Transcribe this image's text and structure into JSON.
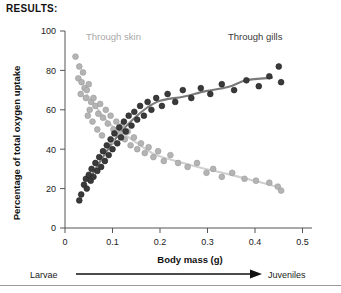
{
  "heading": "RESULTS:",
  "chart_data": {
    "type": "scatter",
    "title": "",
    "xlabel": "Body mass (g)",
    "ylabel": "Percentage of total oxygen uptake",
    "xlim": [
      0,
      0.52
    ],
    "ylim": [
      0,
      100
    ],
    "xticks": [
      0,
      0.1,
      0.2,
      0.3,
      0.4,
      0.5
    ],
    "xtick_labels": [
      "0",
      "0.1",
      "0.2",
      "0.3",
      "0.4",
      "0.5"
    ],
    "yticks": [
      0,
      20,
      40,
      60,
      80,
      100
    ],
    "ytick_labels": [
      "0",
      "20",
      "40",
      "60",
      "80",
      "100"
    ],
    "grid": false,
    "legend_position": "in-plot-annotations",
    "annotations": [
      {
        "text": "Through skin",
        "x": 0.085,
        "y": 96,
        "color": "#a8a8a8"
      },
      {
        "text": "Through gills",
        "x": 0.34,
        "y": 96,
        "color": "#3a3a3a"
      }
    ],
    "axis_arrow": {
      "left_label": "Larvae",
      "right_label": "Juveniles",
      "direction": "left-to-right"
    },
    "series": [
      {
        "name": "Through skin",
        "marker": "circle",
        "color": "#b4b4b4",
        "edge_color": "#9a9a9a",
        "trend_color": "#d0d0d0",
        "points": [
          [
            0.022,
            87
          ],
          [
            0.03,
            82
          ],
          [
            0.028,
            76
          ],
          [
            0.035,
            74
          ],
          [
            0.038,
            79
          ],
          [
            0.041,
            71
          ],
          [
            0.033,
            68
          ],
          [
            0.046,
            70
          ],
          [
            0.05,
            73
          ],
          [
            0.044,
            66
          ],
          [
            0.055,
            64
          ],
          [
            0.052,
            60
          ],
          [
            0.048,
            57
          ],
          [
            0.06,
            66
          ],
          [
            0.064,
            62
          ],
          [
            0.058,
            54
          ],
          [
            0.07,
            58
          ],
          [
            0.074,
            63
          ],
          [
            0.068,
            50
          ],
          [
            0.08,
            56
          ],
          [
            0.086,
            60
          ],
          [
            0.09,
            53
          ],
          [
            0.078,
            47
          ],
          [
            0.096,
            57
          ],
          [
            0.102,
            50
          ],
          [
            0.108,
            54
          ],
          [
            0.1,
            44
          ],
          [
            0.115,
            48
          ],
          [
            0.12,
            52
          ],
          [
            0.126,
            45
          ],
          [
            0.132,
            49
          ],
          [
            0.138,
            42
          ],
          [
            0.145,
            46
          ],
          [
            0.152,
            40
          ],
          [
            0.16,
            43
          ],
          [
            0.168,
            38
          ],
          [
            0.176,
            41
          ],
          [
            0.186,
            36
          ],
          [
            0.196,
            39
          ],
          [
            0.208,
            34
          ],
          [
            0.222,
            37
          ],
          [
            0.238,
            33
          ],
          [
            0.258,
            31
          ],
          [
            0.278,
            33
          ],
          [
            0.298,
            28
          ],
          [
            0.312,
            30
          ],
          [
            0.33,
            26
          ],
          [
            0.352,
            28
          ],
          [
            0.378,
            25
          ],
          [
            0.402,
            24
          ],
          [
            0.43,
            23
          ],
          [
            0.448,
            21
          ],
          [
            0.455,
            19
          ]
        ]
      },
      {
        "name": "Through gills",
        "marker": "circle",
        "color": "#3a3a3a",
        "edge_color": "#222222",
        "trend_color": "#7a7a7a",
        "points": [
          [
            0.03,
            14
          ],
          [
            0.034,
            17
          ],
          [
            0.04,
            22
          ],
          [
            0.044,
            25
          ],
          [
            0.046,
            20
          ],
          [
            0.05,
            27
          ],
          [
            0.054,
            24
          ],
          [
            0.056,
            30
          ],
          [
            0.06,
            26
          ],
          [
            0.064,
            33
          ],
          [
            0.068,
            29
          ],
          [
            0.072,
            36
          ],
          [
            0.076,
            31
          ],
          [
            0.08,
            39
          ],
          [
            0.084,
            34
          ],
          [
            0.088,
            42
          ],
          [
            0.092,
            37
          ],
          [
            0.096,
            45
          ],
          [
            0.1,
            40
          ],
          [
            0.104,
            48
          ],
          [
            0.11,
            43
          ],
          [
            0.114,
            51
          ],
          [
            0.118,
            46
          ],
          [
            0.124,
            54
          ],
          [
            0.128,
            49
          ],
          [
            0.134,
            57
          ],
          [
            0.14,
            52
          ],
          [
            0.146,
            59
          ],
          [
            0.152,
            55
          ],
          [
            0.158,
            62
          ],
          [
            0.166,
            57
          ],
          [
            0.174,
            64
          ],
          [
            0.182,
            60
          ],
          [
            0.192,
            66
          ],
          [
            0.204,
            62
          ],
          [
            0.216,
            68
          ],
          [
            0.232,
            64
          ],
          [
            0.248,
            70
          ],
          [
            0.266,
            66
          ],
          [
            0.286,
            71
          ],
          [
            0.306,
            68
          ],
          [
            0.33,
            73
          ],
          [
            0.356,
            70
          ],
          [
            0.382,
            75
          ],
          [
            0.408,
            72
          ],
          [
            0.43,
            77
          ],
          [
            0.45,
            82
          ],
          [
            0.455,
            74
          ]
        ]
      }
    ]
  }
}
